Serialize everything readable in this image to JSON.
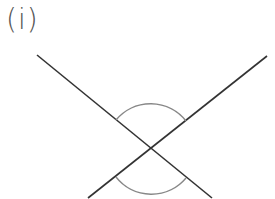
{
  "label": "(i)",
  "figure": {
    "type": "intersecting-lines-vertically-opposite-angles",
    "intersection": {
      "x": 151,
      "y": 149
    },
    "lines": [
      {
        "name": "line-a",
        "x1": 37,
        "y1": 55,
        "x2": 212,
        "y2": 198
      },
      {
        "name": "line-b",
        "x1": 267,
        "y1": 56,
        "x2": 88,
        "y2": 198
      }
    ],
    "angle_arcs": [
      {
        "name": "top-angle-arc",
        "radius": 45,
        "position": "top"
      },
      {
        "name": "bottom-angle-arc",
        "radius": 45,
        "position": "bottom"
      }
    ],
    "colors": {
      "line": "#333333",
      "arc": "#888888",
      "label": "#555555"
    }
  }
}
